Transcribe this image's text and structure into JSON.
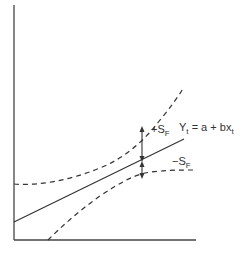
{
  "diagram": {
    "type": "forecast confidence band",
    "axes": {
      "x_axis": "",
      "y_axis": ""
    },
    "regression_line": {
      "label_main": "Y",
      "label_sub": "t",
      "label_rest": " = a + bx",
      "label_rest_sub": "t"
    },
    "upper_band": {
      "sign": "+S",
      "sub": "F"
    },
    "lower_band": {
      "sign": "−S",
      "sub": "F"
    },
    "colors": {
      "line": "#333333",
      "background": "#ffffff"
    }
  }
}
